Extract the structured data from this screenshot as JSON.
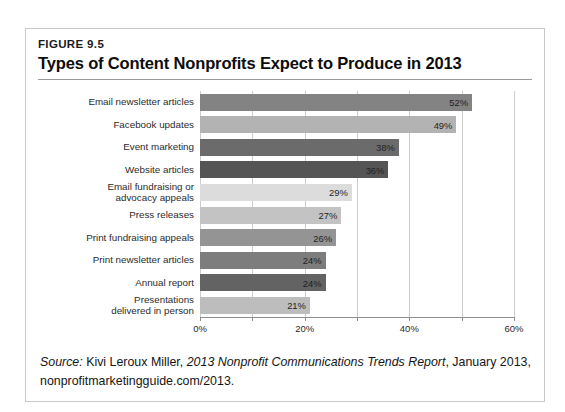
{
  "figure": {
    "number": "FIGURE 9.5",
    "title": "Types of Content Nonprofits Expect to Produce in 2013"
  },
  "source_note": {
    "label": "Source:",
    "author": "Kivi Leroux Miller,",
    "publication": "2013 Nonprofit Communications Trends Report",
    "date": ", January 2013,",
    "url": "nonprofitmarketingguide.com/2013."
  },
  "chart_data": {
    "type": "bar",
    "orientation": "horizontal",
    "title": "Types of Content Nonprofits Expect to Produce in 2013",
    "xlabel": "",
    "ylabel": "",
    "xlim": [
      0,
      60
    ],
    "xticks": [
      0,
      10,
      20,
      30,
      40,
      50,
      60
    ],
    "xticklabels": [
      "0%",
      "",
      "20%",
      "",
      "40%",
      "",
      "60%"
    ],
    "grid": true,
    "legend": "none",
    "value_suffix": "%",
    "categories": [
      "Email newsletter articles",
      "Facebook updates",
      "Event marketing",
      "Website articles",
      "Email fundraising or advocacy appeals",
      "Press releases",
      "Print fundraising appeals",
      "Print newsletter articles",
      "Annual report",
      "Presentations delivered in person"
    ],
    "values": [
      52,
      49,
      38,
      36,
      29,
      27,
      26,
      24,
      24,
      21
    ],
    "labels": [
      "52%",
      "49%",
      "38%",
      "36%",
      "29%",
      "27%",
      "26%",
      "24%",
      "24%",
      "21%"
    ],
    "bar_colors": [
      "#838383",
      "#b3b3b3",
      "#6b6b6b",
      "#555555",
      "#dcdcdc",
      "#c3c3c3",
      "#949494",
      "#7d7d7d",
      "#636363",
      "#bdbdbd"
    ],
    "category_lines": [
      [
        "Email newsletter articles"
      ],
      [
        "Facebook updates"
      ],
      [
        "Event marketing"
      ],
      [
        "Website articles"
      ],
      [
        "Email fundraising or",
        "advocacy appeals"
      ],
      [
        "Press releases"
      ],
      [
        "Print fundraising appeals"
      ],
      [
        "Print newsletter articles"
      ],
      [
        "Annual report"
      ],
      [
        "Presentations",
        "delivered in person"
      ]
    ]
  }
}
